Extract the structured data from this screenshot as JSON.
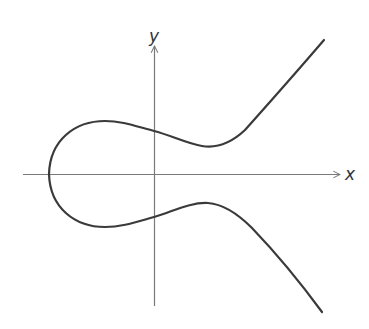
{
  "diagram": {
    "title": "",
    "type": "elliptic-curve",
    "axes": {
      "x_label": "x",
      "y_label": "y"
    },
    "colors": {
      "curve": "#3a3a3a",
      "axes": "#7a7a7a",
      "background": "#ffffff"
    }
  }
}
